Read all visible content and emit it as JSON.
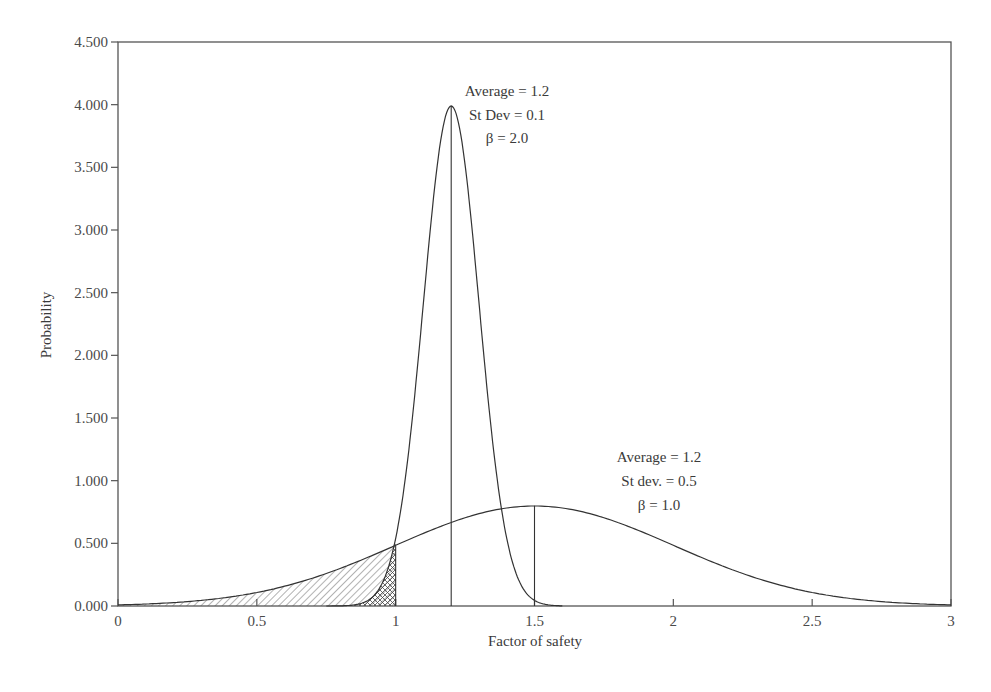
{
  "chart_data": {
    "type": "line",
    "title": "",
    "xlabel": "Factor of safety",
    "ylabel": "Probability",
    "xlim": [
      0,
      3
    ],
    "ylim": [
      0,
      4.5
    ],
    "grid": false,
    "legend": "none",
    "x_ticks": [
      "0",
      "0.5",
      "1",
      "1.5",
      "2",
      "2.5",
      "3"
    ],
    "x_tick_values": [
      0,
      0.5,
      1,
      1.5,
      2,
      2.5,
      3
    ],
    "y_ticks": [
      "0.000",
      "0.500",
      "1.000",
      "1.500",
      "2.000",
      "2.500",
      "3.000",
      "3.500",
      "4.000",
      "4.500"
    ],
    "y_tick_values": [
      0,
      0.5,
      1,
      1.5,
      2,
      2.5,
      3,
      3.5,
      4,
      4.5
    ],
    "series": [
      {
        "name": "Narrow distribution",
        "distribution": "normal",
        "mean": 1.2,
        "sd": 0.1,
        "peak_x": 1.2,
        "peak_y": 3.99,
        "x": [
          0.8,
          0.9,
          1.0,
          1.05,
          1.1,
          1.15,
          1.2,
          1.25,
          1.3,
          1.35,
          1.4,
          1.5,
          1.55
        ],
        "y": [
          0.0,
          0.04,
          0.54,
          1.3,
          2.42,
          3.52,
          3.99,
          3.52,
          2.42,
          1.3,
          0.54,
          0.04,
          0.0
        ],
        "annotation": [
          "Average = 1.2",
          "St Dev = 0.1",
          "β = 2.0"
        ]
      },
      {
        "name": "Wide distribution",
        "distribution": "normal",
        "mean": 1.5,
        "sd": 0.5,
        "peak_x": 1.5,
        "peak_y": 0.8,
        "x": [
          0,
          0.25,
          0.5,
          0.75,
          1.0,
          1.25,
          1.5,
          1.75,
          2.0,
          2.25,
          2.5,
          2.75,
          3.0
        ],
        "y": [
          0.01,
          0.04,
          0.11,
          0.26,
          0.48,
          0.7,
          0.8,
          0.7,
          0.48,
          0.26,
          0.11,
          0.04,
          0.01
        ],
        "annotation": [
          "Average = 1.2",
          "St dev. = 0.5",
          "β = 1.0"
        ]
      }
    ],
    "vertical_lines": [
      {
        "x": 1.0,
        "y_top": 0.48
      },
      {
        "x": 1.2,
        "y_top": 3.99
      },
      {
        "x": 1.5,
        "y_top": 0.8
      }
    ],
    "shaded_regions": [
      {
        "series": "Wide distribution",
        "from": 0,
        "to": 1.0,
        "pattern": "diagonal-hatch"
      },
      {
        "series": "Narrow distribution",
        "from": 0.8,
        "to": 1.0,
        "pattern": "cross-hatch"
      }
    ]
  },
  "labels": {
    "x_axis_title": "Factor of safety",
    "y_axis_title": "Probability",
    "narrow_annotation": [
      "Average = 1.2",
      "St Dev = 0.1",
      "β = 2.0"
    ],
    "wide_annotation": [
      "Average = 1.2",
      "St dev. = 0.5",
      "β = 1.0"
    ]
  }
}
